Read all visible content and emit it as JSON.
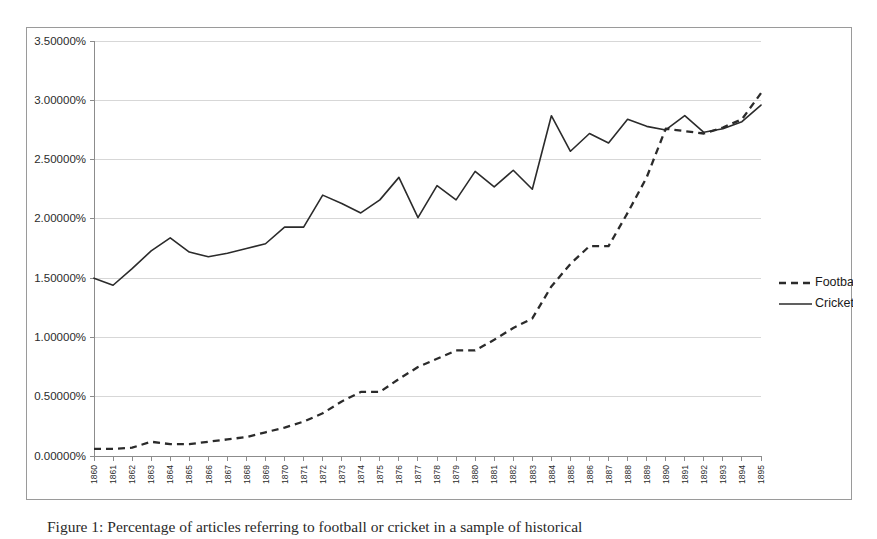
{
  "caption": "Figure 1: Percentage of articles referring to football or cricket in a sample of historical",
  "legend": {
    "position": "right",
    "items": [
      {
        "label": "Football",
        "style": "dashed"
      },
      {
        "label": "Cricket",
        "style": "solid"
      }
    ]
  },
  "chart_data": {
    "type": "line",
    "title": "",
    "xlabel": "",
    "ylabel": "",
    "grid": true,
    "ylim": [
      0,
      3.5
    ],
    "ytick_values": [
      0,
      0.5,
      1.0,
      1.5,
      2.0,
      2.5,
      3.0,
      3.5
    ],
    "ytick_labels": [
      "0.00000%",
      "0.50000%",
      "1.00000%",
      "1.50000%",
      "2.00000%",
      "2.50000%",
      "3.00000%",
      "3.50000%"
    ],
    "categories": [
      "1860",
      "1861",
      "1862",
      "1863",
      "1864",
      "1865",
      "1866",
      "1867",
      "1868",
      "1869",
      "1870",
      "1871",
      "1872",
      "1873",
      "1874",
      "1875",
      "1876",
      "1877",
      "1878",
      "1879",
      "1880",
      "1881",
      "1882",
      "1883",
      "1884",
      "1885",
      "1886",
      "1887",
      "1888",
      "1889",
      "1890",
      "1891",
      "1892",
      "1893",
      "1894",
      "1895"
    ],
    "series": [
      {
        "name": "Football",
        "style": "dashed",
        "color": "#2b2b2b",
        "values": [
          0.06,
          0.06,
          0.07,
          0.12,
          0.1,
          0.1,
          0.12,
          0.14,
          0.16,
          0.2,
          0.24,
          0.29,
          0.36,
          0.46,
          0.54,
          0.54,
          0.65,
          0.75,
          0.82,
          0.89,
          0.89,
          0.98,
          1.08,
          1.16,
          1.43,
          1.62,
          1.77,
          1.77,
          2.05,
          2.35,
          2.76,
          2.74,
          2.72,
          2.77,
          2.84,
          3.06
        ]
      },
      {
        "name": "Cricket",
        "style": "solid",
        "color": "#2b2b2b",
        "values": [
          1.5,
          1.44,
          1.58,
          1.73,
          1.84,
          1.72,
          1.68,
          1.71,
          1.75,
          1.79,
          1.93,
          1.93,
          2.2,
          2.13,
          2.05,
          2.16,
          2.35,
          2.01,
          2.28,
          2.16,
          2.4,
          2.27,
          2.41,
          2.25,
          2.87,
          2.57,
          2.72,
          2.64,
          2.84,
          2.78,
          2.75,
          2.87,
          2.73,
          2.76,
          2.82,
          2.96
        ]
      }
    ]
  }
}
